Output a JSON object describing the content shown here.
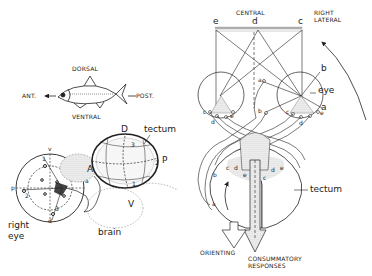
{
  "left_panel": {
    "fish": {
      "dorsal": "DORSAL",
      "ventral": "VENTRAL",
      "anterior": "ANT.",
      "posterior": "POST."
    },
    "eye_brain": {
      "eye_label_line1": "right",
      "eye_label_line2": "eye",
      "brain_label": "brain",
      "tectum_label": "tectum",
      "axis_v": "v",
      "axis_d": "d",
      "axis_p": "p",
      "axis_a": "a",
      "tectum_D": "D",
      "tectum_V": "V",
      "tectum_A": "A",
      "tectum_P": "P",
      "eye_numbers": [
        "1",
        "2",
        "3"
      ],
      "tectum_numbers": [
        "1",
        "2",
        "3"
      ]
    }
  },
  "right_panel": {
    "central": "CENTRAL",
    "right_lateral_line1": "RIGHT",
    "right_lateral_line2": "LATERAL",
    "field_points": [
      "e",
      "d",
      "c"
    ],
    "eye_label": "eye",
    "ray_labels": [
      "a",
      "b"
    ],
    "left_retina_points": [
      "c",
      "d",
      "e"
    ],
    "right_retina_points": [
      "a",
      "b",
      "c",
      "d",
      "e"
    ],
    "tectum_label": "tectum",
    "tectum_left_points": [
      "b",
      "c",
      "d",
      "e",
      "a"
    ],
    "tectum_right_points": [
      "c",
      "d",
      "e"
    ],
    "orienting": "ORIENTING",
    "consummatory_line1": "CONSUMMATORY",
    "consummatory_line2": "RESPONSES"
  },
  "colors": {
    "ink": "#222222",
    "stipple": "#c8c8c8",
    "paper": "#ffffff"
  }
}
